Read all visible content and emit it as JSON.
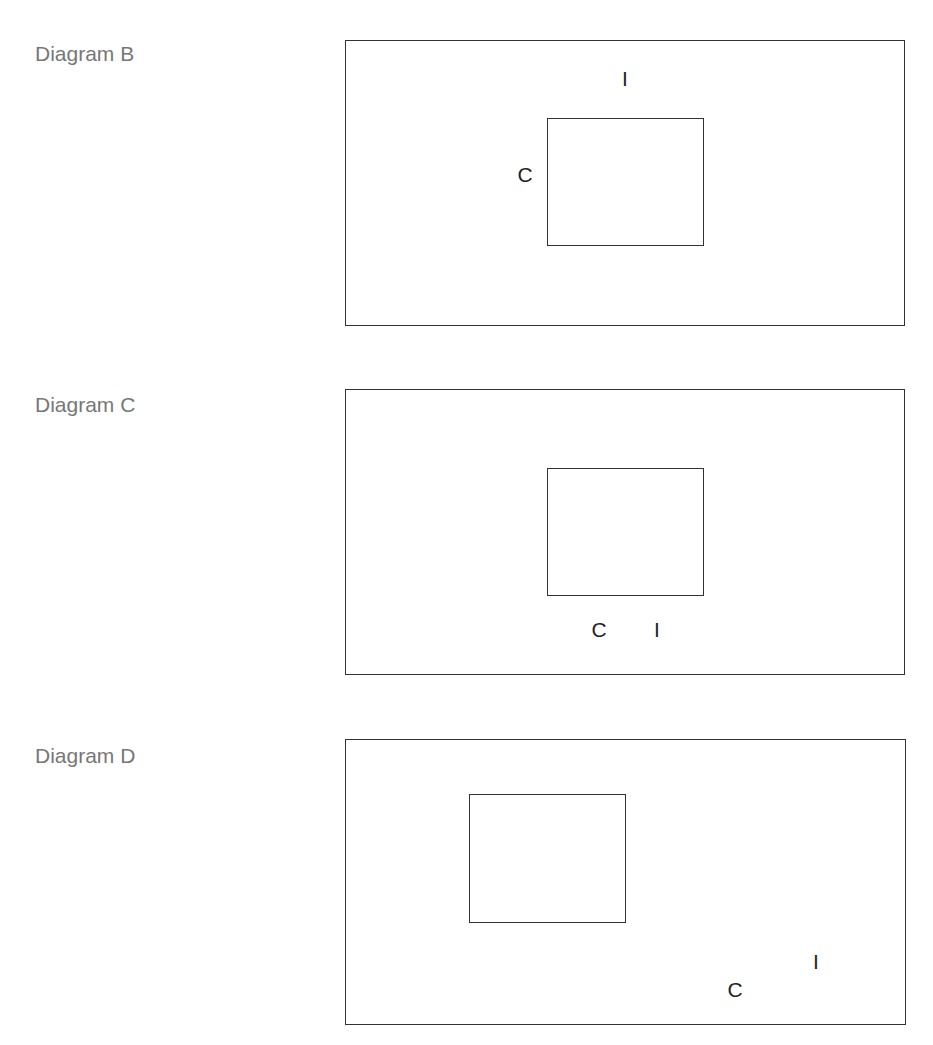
{
  "diagrams": [
    {
      "label": "Diagram B",
      "label_pos": {
        "top": 43
      },
      "outer": {
        "left": 345,
        "top": 40,
        "width": 560,
        "height": 286
      },
      "inner": {
        "left": 547,
        "top": 118,
        "width": 157,
        "height": 128
      },
      "markers": [
        {
          "text": "I",
          "x": 625,
          "y": 78
        },
        {
          "text": "C",
          "x": 525,
          "y": 174
        }
      ]
    },
    {
      "label": "Diagram C",
      "label_pos": {
        "top": 394
      },
      "outer": {
        "left": 345,
        "top": 389,
        "width": 560,
        "height": 286
      },
      "inner": {
        "left": 547,
        "top": 468,
        "width": 157,
        "height": 128
      },
      "markers": [
        {
          "text": "C",
          "x": 599,
          "y": 629
        },
        {
          "text": "I",
          "x": 657,
          "y": 629
        }
      ]
    },
    {
      "label": "Diagram D",
      "label_pos": {
        "top": 745
      },
      "outer": {
        "left": 345,
        "top": 739,
        "width": 561,
        "height": 286
      },
      "inner": {
        "left": 469,
        "top": 794,
        "width": 157,
        "height": 129
      },
      "markers": [
        {
          "text": "I",
          "x": 816,
          "y": 961
        },
        {
          "text": "C",
          "x": 735,
          "y": 989
        }
      ]
    }
  ],
  "colors": {
    "label": "#777777",
    "stroke": "#333333",
    "marker": "#222222"
  }
}
